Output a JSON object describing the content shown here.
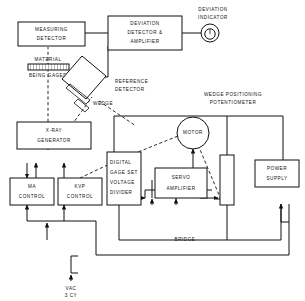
{
  "diagram": {
    "blocks": [
      {
        "id": "measuring-detector",
        "lines": [
          "MEASURING",
          "DETECTOR"
        ]
      },
      {
        "id": "deviation-detector",
        "lines": [
          "DEVIATION",
          "DETECTOR &",
          "AMPLIFIER"
        ]
      },
      {
        "id": "xray-generator",
        "lines": [
          "X-RAY",
          "GENERATOR"
        ]
      },
      {
        "id": "ma-control",
        "lines": [
          "MA",
          "CONTROL"
        ]
      },
      {
        "id": "kvp-control",
        "lines": [
          "KVP",
          "CONTROL"
        ]
      },
      {
        "id": "digital-gage-set",
        "lines": [
          "DIGITAL",
          "GAGE SET",
          "VOLTAGE",
          "DIVIDER"
        ]
      },
      {
        "id": "servo-amplifier",
        "lines": [
          "SERVO",
          "AMPLIFIER"
        ]
      },
      {
        "id": "power-supply",
        "lines": [
          "POWER",
          "SUPPLY"
        ]
      },
      {
        "id": "motor",
        "lines": [
          "MOTOR"
        ]
      }
    ],
    "labels": [
      {
        "id": "deviation-indicator",
        "lines": [
          "DEVIATION",
          "INDICATOR"
        ]
      },
      {
        "id": "material-being-gaged",
        "lines": [
          "MATERIAL",
          "BEING GAGED"
        ]
      },
      {
        "id": "reference-detector",
        "lines": [
          "REFERENCE",
          "DETECTOR"
        ]
      },
      {
        "id": "wedge",
        "lines": [
          "WEDGE"
        ]
      },
      {
        "id": "wedge-pot",
        "lines": [
          "WEDGE POSITIONING",
          "POTENTIOMETER"
        ]
      },
      {
        "id": "bridge",
        "lines": [
          "BRIDGE"
        ]
      },
      {
        "id": "power-source",
        "lines": [
          "VAC",
          "3 CY"
        ]
      }
    ],
    "text": {
      "measuring_detector_l1": "MEASURING",
      "measuring_detector_l2": "DETECTOR",
      "deviation_detector_l1": "DEVIATION",
      "deviation_detector_l2": "DETECTOR &",
      "deviation_detector_l3": "AMPLIFIER",
      "deviation_indicator_l1": "DEVIATION",
      "deviation_indicator_l2": "INDICATOR",
      "material_l1": "MATERIAL",
      "material_l2": "BEING GAGED",
      "reference_detector_l1": "REFERENCE",
      "reference_detector_l2": "DETECTOR",
      "wedge_label": "WEDGE",
      "xray_l1": "X-RAY",
      "xray_l2": "GENERATOR",
      "ma_l1": "MA",
      "ma_l2": "CONTROL",
      "kvp_l1": "KVP",
      "kvp_l2": "CONTROL",
      "digital_l1": "DIGITAL",
      "digital_l2": "GAGE SET",
      "digital_l3": "VOLTAGE",
      "digital_l4": "DIVIDER",
      "motor_label": "MOTOR",
      "servo_l1": "SERVO",
      "servo_l2": "AMPLIFIER",
      "power_l1": "POWER",
      "power_l2": "SUPPLY",
      "wedge_pot_l1": "WEDGE POSITIONING",
      "wedge_pot_l2": "POTENTIOMETER",
      "bridge_label": "BRIDGE",
      "vac_l1": "VAC",
      "vac_l2": "3 CY"
    },
    "colors": {
      "ink": "#111111",
      "paper": "#ffffff"
    }
  }
}
